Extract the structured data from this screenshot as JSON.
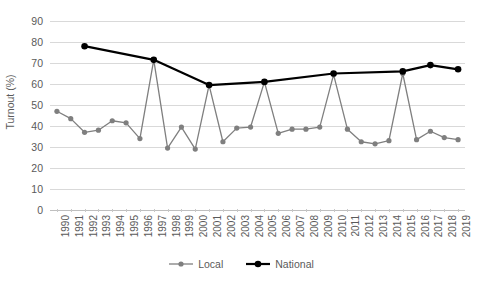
{
  "chart_data": {
    "type": "line",
    "title": "",
    "xlabel": "",
    "ylabel": "Turnout (%)",
    "ylim": [
      0,
      90
    ],
    "ytick_step": 10,
    "grid": true,
    "legend_position": "bottom",
    "x": [
      1990,
      1991,
      1992,
      1993,
      1994,
      1995,
      1996,
      1997,
      1998,
      1999,
      2000,
      2001,
      2002,
      2003,
      2004,
      2005,
      2006,
      2007,
      2008,
      2009,
      2010,
      2011,
      2012,
      2013,
      2014,
      2015,
      2016,
      2017,
      2018,
      2019
    ],
    "xticklabels": [
      "1990",
      "1991",
      "1992",
      "1993",
      "1994",
      "1995",
      "1996",
      "1997",
      "1998",
      "1999",
      "2000",
      "2001",
      "2002",
      "2003",
      "2004",
      "2005",
      "2006",
      "2007",
      "2008",
      "2009",
      "2010",
      "2011",
      "2012",
      "2013",
      "2014",
      "2015",
      "2016",
      "2017",
      "2018",
      "2019"
    ],
    "yticklabels": [
      "0",
      "10",
      "20",
      "30",
      "40",
      "50",
      "60",
      "70",
      "80",
      "90"
    ],
    "series": [
      {
        "name": "Local",
        "color": "#7f7f7f",
        "marker": "circle",
        "values": [
          47,
          43.5,
          37,
          38,
          42.5,
          41.5,
          34,
          71.5,
          29.5,
          39.5,
          29,
          59.5,
          32.5,
          39,
          39.5,
          61,
          36.5,
          38.5,
          38.5,
          39.5,
          64.5,
          38.5,
          32.5,
          31.5,
          33,
          65,
          33.5,
          37.5,
          34.5,
          33.5
        ]
      },
      {
        "name": "National",
        "color": "#000000",
        "marker": "circle",
        "x": [
          1992,
          1997,
          2001,
          2005,
          2010,
          2015,
          2017,
          2019
        ],
        "values": [
          78,
          71.5,
          59.5,
          61,
          65,
          66,
          69,
          67
        ]
      }
    ]
  },
  "legend": {
    "items": [
      {
        "label": "Local",
        "color": "#7f7f7f"
      },
      {
        "label": "National",
        "color": "#000000"
      }
    ]
  }
}
